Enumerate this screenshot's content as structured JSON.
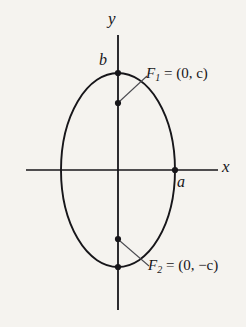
{
  "figure": {
    "type": "geometry-diagram",
    "background_color": "#f5f3ef",
    "stroke_color": "#17161a"
  },
  "axes": {
    "x_axis_label": "x",
    "y_axis_label": "y",
    "x_axis": {
      "y": 170,
      "x_start": 26,
      "x_end": 218
    },
    "y_axis": {
      "x": 118,
      "y_start": 35,
      "y_end": 310
    }
  },
  "curve": {
    "name": "ellipse",
    "center": {
      "x": 118,
      "y": 170
    },
    "semi_axis_x": 57,
    "semi_axis_y": 97
  },
  "vertex_labels": {
    "minor_vertex_top": "b",
    "major_vertex_right": "a"
  },
  "foci": [
    {
      "name": "F1",
      "symbol": "F",
      "subscript": "1",
      "equals": "=",
      "coordinates": "(0, c)",
      "full_label": "F₁ = (0, c)",
      "point": {
        "x": 118,
        "y": 103
      }
    },
    {
      "name": "F2",
      "symbol": "F",
      "subscript": "2",
      "equals": "=",
      "coordinates": "(0, −c)",
      "full_label": "F₂ = (0, −c)",
      "point": {
        "x": 118,
        "y": 239
      }
    }
  ],
  "marked_points": [
    {
      "name": "minor-vertex-top",
      "x": 118,
      "y": 73
    },
    {
      "name": "minor-vertex-bottom",
      "x": 118,
      "y": 267
    },
    {
      "name": "major-vertex-right",
      "x": 175,
      "y": 170
    },
    {
      "name": "focus-upper",
      "x": 118,
      "y": 103
    },
    {
      "name": "focus-lower",
      "x": 118,
      "y": 239
    }
  ]
}
